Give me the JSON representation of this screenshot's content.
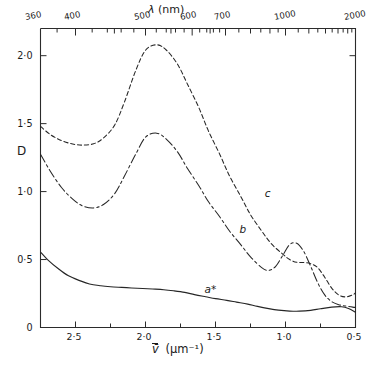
{
  "chart_data": {
    "type": "line",
    "title": "",
    "xlabel": "v̄ (μm⁻¹)",
    "ylabel": "D",
    "top_axis_label": "λ (nm)",
    "grid": false,
    "legend_position": "inline-annotations",
    "x_axis": {
      "label": "v̄ (μm⁻¹)",
      "direction": "reversed",
      "range": [
        2.75,
        0.5
      ],
      "tick_labels": [
        "2·5",
        "2·0",
        "1·5",
        "1·0",
        "0·5"
      ],
      "tick_values": [
        2.5,
        2.0,
        1.5,
        1.0,
        0.5
      ],
      "minor_tick_values": [
        2.75,
        2.25,
        1.75,
        1.25,
        0.75
      ]
    },
    "y_axis": {
      "label": "D",
      "range": [
        0,
        2.2
      ],
      "tick_labels": [
        "0",
        "0·5",
        "1·0",
        "1·5",
        "2·0"
      ],
      "tick_values": [
        0,
        0.5,
        1.0,
        1.5,
        2.0
      ]
    },
    "top_x_axis": {
      "label": "λ (nm)",
      "unit": "nm",
      "tick_labels": [
        "360",
        "400",
        "500",
        "600",
        "700",
        "1000",
        "2000"
      ],
      "tick_values": [
        360,
        400,
        500,
        600,
        700,
        1000,
        2000
      ],
      "minor_tick_values": [
        450,
        550,
        650,
        800,
        900,
        1200,
        1400,
        1600,
        1800,
        2000
      ]
    },
    "series": [
      {
        "name": "a*",
        "annotation": "a*",
        "style": "solid",
        "x": [
          2.75,
          2.7,
          2.62,
          2.55,
          2.47,
          2.4,
          2.32,
          2.25,
          2.17,
          2.1,
          2.02,
          1.95,
          1.87,
          1.8,
          1.72,
          1.65,
          1.57,
          1.5,
          1.42,
          1.35,
          1.27,
          1.2,
          1.12,
          1.05,
          0.97,
          0.9,
          0.82,
          0.75,
          0.67,
          0.6,
          0.55,
          0.5
        ],
        "y": [
          0.555,
          0.5,
          0.43,
          0.38,
          0.345,
          0.32,
          0.307,
          0.3,
          0.295,
          0.291,
          0.287,
          0.283,
          0.278,
          0.27,
          0.258,
          0.242,
          0.226,
          0.212,
          0.2,
          0.187,
          0.172,
          0.155,
          0.139,
          0.128,
          0.121,
          0.12,
          0.126,
          0.138,
          0.15,
          0.153,
          0.14,
          0.112
        ]
      },
      {
        "name": "b",
        "annotation": "b",
        "style": "dash-dot",
        "x": [
          2.75,
          2.68,
          2.6,
          2.52,
          2.45,
          2.37,
          2.3,
          2.22,
          2.15,
          2.07,
          2.0,
          1.92,
          1.85,
          1.77,
          1.7,
          1.62,
          1.55,
          1.47,
          1.4,
          1.32,
          1.25,
          1.17,
          1.12,
          1.07,
          1.02,
          0.97,
          0.92,
          0.87,
          0.82,
          0.77,
          0.72,
          0.67,
          0.62,
          0.57,
          0.52,
          0.5
        ],
        "y": [
          1.275,
          1.15,
          1.03,
          0.945,
          0.895,
          0.88,
          0.905,
          0.985,
          1.115,
          1.275,
          1.4,
          1.43,
          1.385,
          1.29,
          1.17,
          1.045,
          0.925,
          0.815,
          0.71,
          0.61,
          0.52,
          0.44,
          0.42,
          0.45,
          0.53,
          0.61,
          0.62,
          0.56,
          0.45,
          0.33,
          0.24,
          0.19,
          0.168,
          0.158,
          0.15,
          0.148
        ]
      },
      {
        "name": "c",
        "annotation": "c",
        "style": "dashed",
        "x": [
          2.75,
          2.68,
          2.6,
          2.52,
          2.45,
          2.37,
          2.3,
          2.22,
          2.15,
          2.07,
          2.0,
          1.92,
          1.85,
          1.77,
          1.7,
          1.62,
          1.55,
          1.47,
          1.4,
          1.32,
          1.25,
          1.17,
          1.1,
          1.02,
          0.97,
          0.92,
          0.87,
          0.82,
          0.77,
          0.72,
          0.67,
          0.62,
          0.57,
          0.52,
          0.5
        ],
        "y": [
          1.48,
          1.42,
          1.375,
          1.35,
          1.342,
          1.352,
          1.395,
          1.49,
          1.66,
          1.89,
          2.04,
          2.08,
          2.04,
          1.935,
          1.79,
          1.62,
          1.445,
          1.275,
          1.115,
          0.965,
          0.83,
          0.71,
          0.615,
          0.54,
          0.5,
          0.48,
          0.478,
          0.47,
          0.44,
          0.37,
          0.29,
          0.24,
          0.225,
          0.24,
          0.255
        ]
      }
    ],
    "annotations": [
      {
        "text": "a*",
        "x": 1.55,
        "y": 0.275
      },
      {
        "text": "b",
        "x": 1.3,
        "y": 0.715
      },
      {
        "text": "c",
        "x": 1.12,
        "y": 0.98
      }
    ]
  },
  "axis_text": {
    "y_label": "D",
    "y_ticks": [
      "2·0",
      "1·5",
      "1·0",
      "0·5",
      "0"
    ],
    "x_label_v": "v̄",
    "x_label_unit": "(μm⁻¹)",
    "x_ticks": [
      "2·5",
      "2·0",
      "1·5",
      "1·0",
      "0·5"
    ],
    "top_label_lambda": "λ",
    "top_label_unit": "(nm)",
    "top_ticks": [
      "360",
      "400",
      "500",
      "600",
      "700",
      "1000",
      "2000"
    ]
  },
  "curve_labels": {
    "a": "a*",
    "b": "b",
    "c": "c"
  },
  "colors": {
    "ink": "#1a1a1a",
    "axis": "#333333",
    "background": "#ffffff"
  }
}
